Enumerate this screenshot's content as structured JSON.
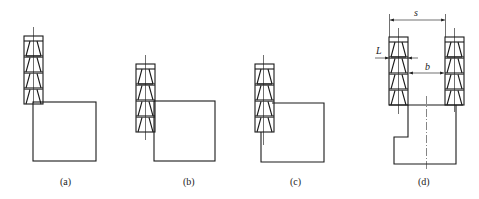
{
  "figure": {
    "panels": [
      {
        "id": "a",
        "label": "(a)",
        "description": "Tool stack above workpiece, tool bottom at workpiece top edge"
      },
      {
        "id": "b",
        "label": "(b)",
        "description": "Tool stack beside workpiece, overlapping workpiece top"
      },
      {
        "id": "c",
        "label": "(c)",
        "description": "Tool stack overlapping workpiece left edge"
      },
      {
        "id": "d",
        "label": "(d)",
        "description": "Two tool stacks straddling stepped workpiece"
      }
    ],
    "dimensions": {
      "s": "s",
      "b": "b",
      "L": "L"
    }
  }
}
